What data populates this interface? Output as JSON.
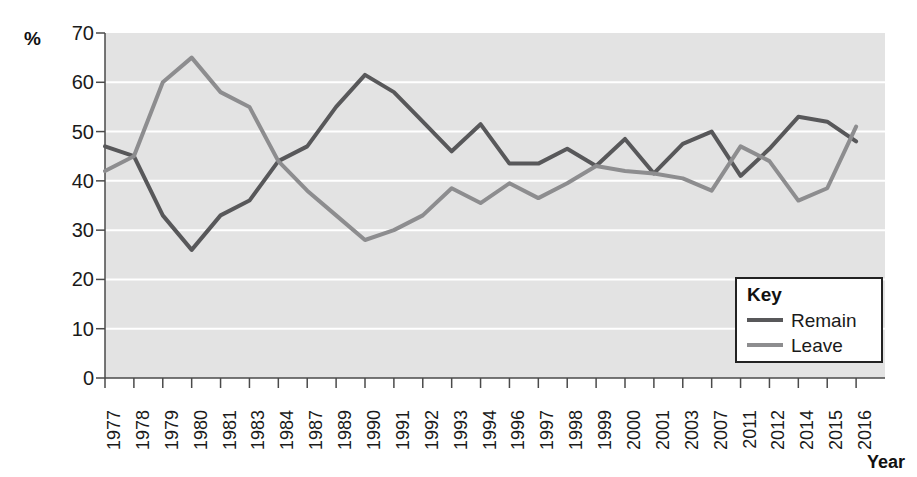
{
  "chart_data": {
    "type": "line",
    "title": "",
    "xlabel": "Year",
    "ylabel": "%",
    "ylim": [
      0,
      70
    ],
    "ytick_step": 10,
    "yticks": [
      70,
      60,
      50,
      40,
      30,
      20,
      10,
      0
    ],
    "grid": true,
    "grid_color": "#ffffff",
    "plot_background": "#e3e3e3",
    "legend_position": "bottom-right",
    "legend_title": "Key",
    "categories": [
      "1977",
      "1978",
      "1979",
      "1980",
      "1981",
      "1983",
      "1984",
      "1987",
      "1989",
      "1990",
      "1991",
      "1992",
      "1993",
      "1994",
      "1996",
      "1997",
      "1998",
      "1999",
      "2000",
      "2001",
      "2003",
      "2007",
      "2011",
      "2012",
      "2014",
      "2015",
      "2016"
    ],
    "series": [
      {
        "name": "Remain",
        "color": "#58585a",
        "values": [
          47,
          45,
          33,
          26,
          33,
          36,
          44,
          47,
          55,
          61.5,
          58,
          52,
          46,
          51.5,
          43.5,
          43.5,
          46.5,
          43,
          48.5,
          41.5,
          47.5,
          50,
          41,
          46.5,
          53,
          52,
          48
        ]
      },
      {
        "name": "Leave",
        "color": "#8d8d8f",
        "values": [
          42,
          45,
          60,
          65,
          58,
          55,
          44,
          38,
          33,
          28,
          30,
          33,
          38.5,
          35.5,
          39.5,
          36.5,
          39.5,
          43,
          42,
          41.5,
          40.5,
          38,
          47,
          44,
          36,
          38.5,
          51
        ]
      }
    ]
  },
  "legend": {
    "title": "Key",
    "items": [
      {
        "label": "Remain",
        "color": "#58585a"
      },
      {
        "label": "Leave",
        "color": "#8d8d8f"
      }
    ]
  },
  "axes": {
    "y_unit": "%",
    "x_title": "Year"
  }
}
